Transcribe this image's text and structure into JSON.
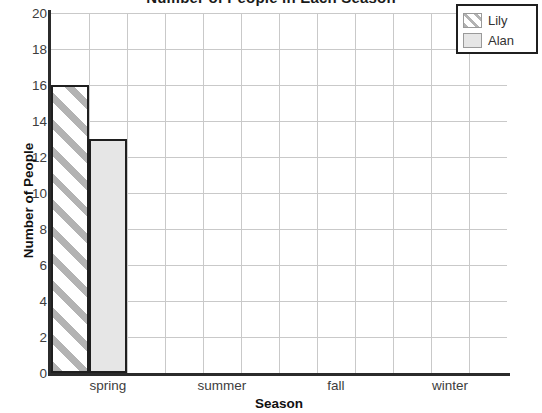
{
  "chart_data": {
    "type": "bar",
    "title": "Number of People in Each Season",
    "xlabel": "Season",
    "ylabel": "Number of People",
    "categories": [
      "spring",
      "summer",
      "fall",
      "winter"
    ],
    "series": [
      {
        "name": "Lily",
        "values": [
          16,
          0,
          0,
          0
        ],
        "fill": "diagonal-stripes",
        "color": "#b3b3b3"
      },
      {
        "name": "Alan",
        "values": [
          13,
          0,
          0,
          0
        ],
        "fill": "solid",
        "color": "#e6e6e6"
      }
    ],
    "ylim": [
      0,
      20
    ],
    "ytick_step": 2,
    "yticks": [
      0,
      2,
      4,
      6,
      8,
      10,
      12,
      14,
      16,
      18,
      20
    ],
    "grid": true,
    "grid_vertical_divisions": 12,
    "legend_position": "top-right",
    "legend_entries": [
      "Lily",
      "Alan"
    ]
  },
  "axis": {
    "y_title": "Number of People",
    "x_title": "Season"
  },
  "legend": {
    "items": [
      {
        "label": "Lily",
        "swatch": "striped"
      },
      {
        "label": "Alan",
        "swatch": "solid"
      }
    ]
  },
  "colors": {
    "axis": "#2b2b2b",
    "gridline": "#c9c9c9",
    "bar_outline": "#1f1f1f",
    "stripe": "#b3b3b3",
    "solid_fill": "#e6e6e6",
    "text": "#3d3d3d"
  }
}
